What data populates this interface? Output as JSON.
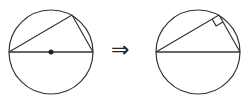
{
  "diagram": {
    "left_figure": {
      "circle": {
        "cx": 51,
        "cy": 52,
        "r": 42
      },
      "center_dot": true,
      "triangle": [
        [
          9,
          52
        ],
        [
          93,
          52
        ],
        [
          72,
          15
        ]
      ]
    },
    "arrow": {
      "glyph": "⇒",
      "meaning": "implies"
    },
    "right_figure": {
      "circle": {
        "cx": 198,
        "cy": 52,
        "r": 42
      },
      "right_angle_marker": true,
      "triangle": [
        [
          156,
          52
        ],
        [
          240,
          52
        ],
        [
          219,
          15
        ]
      ]
    },
    "stroke_color": "#333333"
  }
}
